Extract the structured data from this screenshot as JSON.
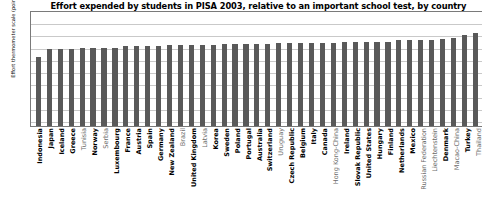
{
  "chart_data": {
    "type": "bar",
    "title": "Effort expended by students in PISA 2003, relative to an important school test, by country",
    "xlabel": "",
    "ylabel": "Effort thermometer scale (points)",
    "ylim": [
      1,
      10
    ],
    "yticks": [
      10,
      9,
      8,
      7,
      6,
      5,
      4,
      3,
      2,
      1
    ],
    "grid": true,
    "legend": "none",
    "categories": [
      "Indonesia",
      "Japan",
      "Iceland",
      "Greece",
      "Tunisia",
      "Norway",
      "Serbia",
      "Luxembourg",
      "France",
      "Austria",
      "Spain",
      "Germany",
      "New Zealand",
      "Brazil",
      "United Kingdom",
      "Latvia",
      "Korea",
      "Sweden",
      "Poland",
      "Portugal",
      "Australia",
      "Switzerland",
      "Uruguay",
      "Czech Republic",
      "Belgium",
      "Italy",
      "Canada",
      "Hong Kong-China",
      "Ireland",
      "Slovak Republic",
      "United States",
      "Hungary",
      "Finland",
      "Netherlands",
      "Mexico",
      "Russian Federation",
      "Liechtenstein",
      "Denmark",
      "Macao-China",
      "Turkey",
      "Thailand"
    ],
    "values": [
      6.2,
      6.9,
      6.9,
      6.9,
      7.0,
      7.0,
      7.0,
      7.0,
      7.1,
      7.1,
      7.1,
      7.1,
      7.2,
      7.2,
      7.2,
      7.2,
      7.2,
      7.3,
      7.3,
      7.3,
      7.3,
      7.3,
      7.4,
      7.4,
      7.4,
      7.4,
      7.4,
      7.4,
      7.5,
      7.5,
      7.5,
      7.5,
      7.5,
      7.6,
      7.6,
      7.6,
      7.6,
      7.7,
      7.8,
      8.0,
      8.2
    ],
    "label_styles": [
      "bold",
      "bold",
      "bold",
      "bold",
      "light",
      "bold",
      "light",
      "bold",
      "bold",
      "bold",
      "bold",
      "bold",
      "bold",
      "light",
      "bold",
      "light",
      "bold",
      "bold",
      "bold",
      "bold",
      "bold",
      "bold",
      "light",
      "bold",
      "bold",
      "bold",
      "bold",
      "light",
      "bold",
      "bold",
      "bold",
      "bold",
      "bold",
      "bold",
      "bold",
      "light",
      "light",
      "bold",
      "light",
      "bold",
      "light"
    ]
  }
}
